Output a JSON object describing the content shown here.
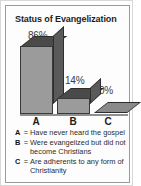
{
  "chart_data": {
    "type": "bar",
    "title": "Status of Evangelization",
    "categories": [
      "A",
      "B",
      "C"
    ],
    "values": [
      86,
      14,
      0
    ],
    "value_labels": [
      "86%",
      "14%",
      "0%"
    ],
    "xlabel": "",
    "ylabel": "",
    "ylim": [
      0,
      100
    ],
    "grid": false,
    "legend_position": "below",
    "style": "3d-bar",
    "legend": [
      {
        "key": "A",
        "separator": "=",
        "text": "Have never heard the gospel"
      },
      {
        "key": "B",
        "separator": "=",
        "text": "Were evangelized but did not become Christians"
      },
      {
        "key": "C",
        "separator": "=",
        "text": "Are adherents to any form of Christianity"
      }
    ],
    "colors": {
      "bar_front": "#9b9b9b",
      "bar_top": "#4a4a4a",
      "bar_side": "#5a5a5a",
      "outline": "#3a3a3a",
      "text": "#1c1c1c",
      "frame": "#9a9a9a",
      "background": "#fdfdfd"
    }
  }
}
